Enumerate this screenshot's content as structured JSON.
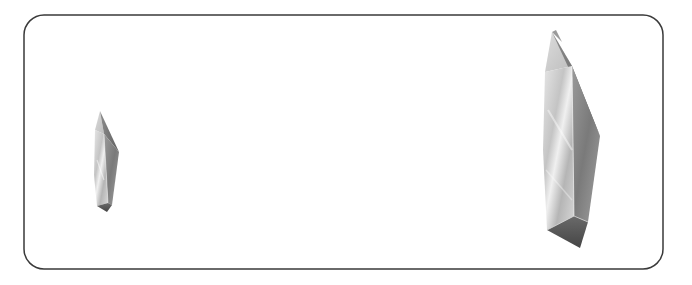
{
  "scene": {
    "description": "Two elongated faceted crystal prisms inside a rounded rectangular frame",
    "background": "#ffffff",
    "frame": {
      "x": 24,
      "y": 15,
      "width": 639,
      "height": 254,
      "radius": 20,
      "stroke": "#3a3a3a",
      "stroke_width": 1.5
    },
    "objects": [
      {
        "name": "small-crystal",
        "label": "small crystal prism",
        "position": "left",
        "x": 93,
        "y": 111,
        "width": 27,
        "height": 101
      },
      {
        "name": "large-crystal",
        "label": "large crystal prism",
        "position": "right",
        "x": 538,
        "y": 24,
        "width": 72,
        "height": 226
      }
    ],
    "colors": {
      "highlight": "#f2f2f2",
      "light": "#cfcfcf",
      "mid": "#a8a8a8",
      "dark": "#6e6e6e",
      "darkest": "#4a4a4a"
    }
  }
}
